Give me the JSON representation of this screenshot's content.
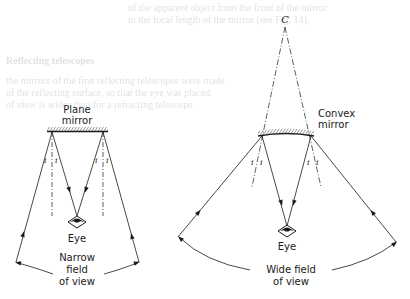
{
  "background_bleed_text": [
    {
      "text": "of the apparent object from the front of the mirror",
      "x": 128,
      "y": 2
    },
    {
      "text": "to the focal length of the mirror (see Fig. 14).",
      "x": 128,
      "y": 14
    },
    {
      "text": "Reflecting telescopes",
      "x": 6,
      "y": 55
    },
    {
      "text": "the mirrors of the first reflecting telescopes were made",
      "x": 6,
      "y": 75
    },
    {
      "text": "of the reflecting surface, so that the eye was placed",
      "x": 6,
      "y": 87
    },
    {
      "text": "of view is wider than for a refracting telescope",
      "x": 6,
      "y": 99
    }
  ],
  "left_diagram": {
    "title_line1": "Plane",
    "title_line2": "mirror",
    "angle_label": "i",
    "eye_label": "Eye",
    "fov_line1": "Narrow",
    "fov_line2": "field",
    "fov_line3": "of view"
  },
  "right_diagram": {
    "center_label": "C",
    "title_line1": "Convex",
    "title_line2": "mirror",
    "angle_label": "i",
    "eye_label": "Eye",
    "fov_line1": "Wide field",
    "fov_line2": "of view"
  },
  "colors": {
    "ink": "#1a1a1a",
    "bleed": "#c9c9c9",
    "paper": "#ffffff"
  }
}
